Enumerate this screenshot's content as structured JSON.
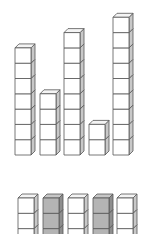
{
  "colors": {
    "white_front": "#ffffff",
    "white_top": "#f4f4f4",
    "white_side": "#c8c8c8",
    "gray_front": "#b4b4b4",
    "gray_top": "#c6c6c6",
    "gray_side": "#8e8e8e",
    "stroke": "#555555"
  },
  "cube": {
    "w": 16,
    "h": 15.3,
    "dx": 4,
    "dy": 4
  },
  "top_row": {
    "baseline_y": 155,
    "towers": [
      {
        "x": 15,
        "count": 7,
        "color": "white"
      },
      {
        "x": 40,
        "count": 4,
        "color": "white"
      },
      {
        "x": 64,
        "count": 8,
        "color": "white"
      },
      {
        "x": 89,
        "count": 2,
        "color": "white"
      },
      {
        "x": 113,
        "count": 9,
        "color": "white"
      }
    ]
  },
  "bottom_row": {
    "top_y": 198,
    "visible_count": 3,
    "towers": [
      {
        "x": 18,
        "color": "white"
      },
      {
        "x": 43,
        "color": "gray"
      },
      {
        "x": 68,
        "color": "white"
      },
      {
        "x": 93,
        "color": "gray"
      },
      {
        "x": 117,
        "color": "white"
      }
    ]
  }
}
